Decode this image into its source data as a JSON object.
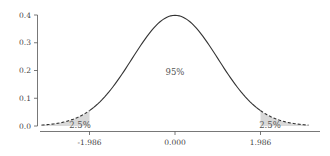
{
  "chart_data": {
    "type": "line",
    "title": "",
    "xlabel": "",
    "ylabel": "",
    "x_ticks": [
      "-1.986",
      "0.000",
      "1.986"
    ],
    "x_tick_values": [
      -1.986,
      0.0,
      1.986
    ],
    "y_ticks": [
      "0.0",
      "0.1",
      "0.2",
      "0.3",
      "0.4"
    ],
    "y_tick_values": [
      0.0,
      0.1,
      0.2,
      0.3,
      0.4
    ],
    "xlim": [
      -3.6,
      3.6
    ],
    "ylim": [
      0,
      0.4
    ],
    "grid": false,
    "series": [
      {
        "name": "density (center)",
        "style": "solid",
        "x_range": [
          -1.986,
          1.986
        ],
        "peak": 0.399
      },
      {
        "name": "density (tails)",
        "style": "dashed",
        "x_range": [
          [
            -3.1,
            -1.986
          ],
          [
            1.986,
            3.1
          ]
        ]
      }
    ],
    "annotations": [
      {
        "text": "95%",
        "x": 0.0,
        "y": 0.22
      },
      {
        "text": "2.5%",
        "x": -2.2,
        "y": 0.01
      },
      {
        "text": "2.5%",
        "x": 2.2,
        "y": 0.01
      }
    ],
    "colors": {
      "line": "#333333",
      "shade": "#d9d9d9",
      "text": "#555555"
    }
  }
}
